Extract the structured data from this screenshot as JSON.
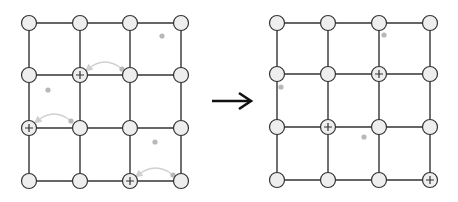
{
  "colors": {
    "background": "#ffffff",
    "edge": "#333333",
    "node_fill": "#eeeeee",
    "node_stroke": "#333333",
    "dot": "#b8b8b8",
    "move_arrow": "#d0d0d0",
    "transition_arrow": "#111111"
  },
  "grid_size": 4,
  "node_radius": 7.5,
  "left_grid": {
    "xs": [
      29,
      80,
      130,
      181
    ],
    "ys": [
      23,
      75,
      128,
      181
    ],
    "plus_nodes": [
      [
        1,
        1
      ],
      [
        0,
        2
      ],
      [
        2,
        3
      ]
    ],
    "dots": [
      [
        162,
        36
      ],
      [
        48,
        90
      ],
      [
        155,
        142
      ]
    ],
    "move_arrows": [
      {
        "from": [
          122,
          69
        ],
        "to": [
          88,
          69
        ]
      },
      {
        "from": [
          71,
          121
        ],
        "to": [
          37,
          121
        ]
      },
      {
        "from": [
          173,
          175
        ],
        "to": [
          138,
          175
        ]
      }
    ]
  },
  "right_grid": {
    "xs": [
      277,
      328,
      379,
      430
    ],
    "ys": [
      23,
      74,
      127,
      180
    ],
    "plus_nodes": [
      [
        2,
        1
      ],
      [
        1,
        2
      ],
      [
        3,
        3
      ]
    ],
    "dots": [
      [
        384,
        35
      ],
      [
        281,
        87
      ],
      [
        364,
        137
      ]
    ],
    "move_arrows": []
  },
  "transition_arrow": {
    "from": [
      212,
      101
    ],
    "to": [
      251,
      101
    ]
  }
}
